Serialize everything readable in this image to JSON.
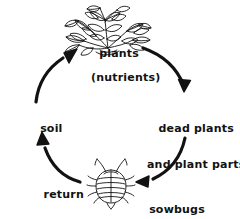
{
  "diagram": {
    "type": "cycle-diagram",
    "style": "hand-drawn black ink line art on white",
    "colors": {
      "ink": "#121212",
      "background": "#ffffff"
    },
    "nodes": [
      {
        "id": "plants",
        "label_line_1": "plants",
        "label_line_2": "(nutrients)",
        "illustration": "leafy-plant"
      },
      {
        "id": "dead-plants",
        "label_line_1": "dead plants",
        "label_line_2": "and plant parts",
        "illustration": "none"
      },
      {
        "id": "sowbugs",
        "label_line_1": "sowbugs",
        "illustration": "sowbug"
      },
      {
        "id": "soil",
        "label_line_1": "soil",
        "illustration": "none"
      }
    ],
    "arrows": [
      {
        "id": "plants-to-dead",
        "from": "plants",
        "to": "dead-plants",
        "direction": "down-right"
      },
      {
        "id": "dead-to-sowbugs",
        "from": "dead-plants",
        "to": "sowbugs",
        "direction": "down-left"
      },
      {
        "id": "sowbugs-to-soil",
        "from": "sowbugs",
        "to": "soil",
        "label_line_1": "return",
        "label_line_2": "nutrients to",
        "label_line_3": "soil",
        "direction": "up-left"
      },
      {
        "id": "soil-to-plants",
        "from": "soil",
        "to": "plants",
        "direction": "up-right"
      }
    ]
  }
}
